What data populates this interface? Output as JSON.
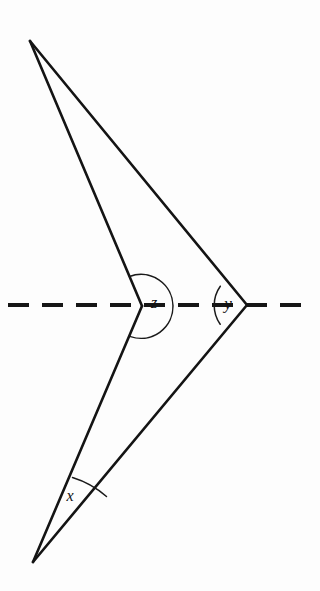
{
  "figure": {
    "background_color": "#fdfdfd",
    "line_color": "#141414",
    "arc_color": "#1a1a1a",
    "width": 320,
    "height": 591
  },
  "labels": {
    "x": "x",
    "y": "y",
    "z": "z"
  },
  "vertices": {
    "top_apex": {
      "name": "top-apex",
      "x": 30,
      "y": 41
    },
    "bottom_apex": {
      "name": "bottom-apex",
      "x": 33,
      "y": 562
    },
    "z_vertex": {
      "name": "z-vertex",
      "x": 142,
      "y": 306
    },
    "y_vertex": {
      "name": "y-vertex",
      "x": 247,
      "y": 305
    }
  },
  "segments": [
    {
      "name": "top-apex-to-z-vertex",
      "x1": 30,
      "y1": 41,
      "x2": 142,
      "y2": 306
    },
    {
      "name": "top-apex-to-y-vertex",
      "x1": 30,
      "y1": 41,
      "x2": 247,
      "y2": 305
    },
    {
      "name": "z-vertex-to-bottom-apex",
      "x1": 142,
      "y1": 306,
      "x2": 33,
      "y2": 562
    },
    {
      "name": "y-vertex-to-bottom-apex",
      "x1": 247,
      "y1": 305,
      "x2": 33,
      "y2": 562
    }
  ],
  "dashed_line": {
    "name": "horizontal-dashed-line",
    "y": 305,
    "x_start": 8,
    "x_end": 313,
    "dash_length": 21,
    "gap_length": 13
  },
  "arcs": {
    "x_arc": {
      "name": "x-angle-arc",
      "center_x": 33,
      "center_y": 562,
      "radius": 93,
      "sweep": "narrow"
    },
    "y_arc": {
      "name": "y-angle-arc",
      "center_x": 247,
      "center_y": 305,
      "radius": 33,
      "sweep": "left-opening"
    },
    "z_arc": {
      "name": "z-angle-arc",
      "center_x": 142,
      "center_y": 306,
      "radius": 32,
      "sweep": "reflex"
    }
  },
  "label_positions": {
    "x": {
      "x": 70,
      "y": 497
    },
    "y": {
      "x": 228,
      "y": 305
    },
    "z": {
      "x": 154,
      "y": 304
    }
  }
}
